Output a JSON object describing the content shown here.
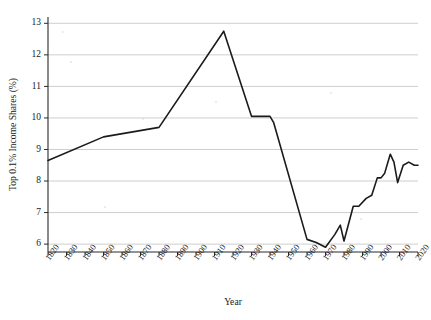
{
  "chart_data": {
    "type": "line",
    "title": "",
    "subtitle": "",
    "xlabel": "Year",
    "ylabel": "Top 0.1% Income Shares (%)",
    "xlim": [
      1820,
      2020
    ],
    "ylim": [
      5.75,
      13.2
    ],
    "yticks": [
      6,
      7,
      8,
      9,
      10,
      11,
      12,
      13
    ],
    "ytick_labels": [
      "6",
      "7",
      "8",
      "9",
      "10",
      "11",
      "12",
      "13"
    ],
    "xticks": [
      1820,
      1830,
      1840,
      1850,
      1860,
      1870,
      1880,
      1890,
      1900,
      1910,
      1920,
      1930,
      1940,
      1950,
      1960,
      1970,
      1980,
      1990,
      2000,
      2010,
      2020
    ],
    "xtick_labels": [
      "1820",
      "1830",
      "1840",
      "1850",
      "1860",
      "1870",
      "1880",
      "1890",
      "1900",
      "1910",
      "1920",
      "1930",
      "1940",
      "1950",
      "1960",
      "1970",
      "1980",
      "1990",
      "2000",
      "2010",
      "2020"
    ],
    "grid": "horizontal",
    "legend": "none",
    "series": [
      {
        "name": "Top 0.1% Income Shares",
        "color": "#1b1b1b",
        "x": [
          1820,
          1850,
          1880,
          1915,
          1930,
          1940,
          1942,
          1960,
          1965,
          1970,
          1975,
          1978,
          1980,
          1985,
          1988,
          1992,
          1995,
          1998,
          2000,
          2002,
          2005,
          2007,
          2009,
          2012,
          2015,
          2018,
          2020
        ],
        "values": [
          8.65,
          9.4,
          9.7,
          12.75,
          10.05,
          10.05,
          9.85,
          6.15,
          6.05,
          5.9,
          6.3,
          6.6,
          6.1,
          7.2,
          7.2,
          7.45,
          7.55,
          8.1,
          8.1,
          8.25,
          8.85,
          8.6,
          7.95,
          8.5,
          8.6,
          8.5,
          8.5
        ]
      }
    ]
  },
  "figure": {
    "plot_left": 48,
    "plot_right": 418,
    "plot_top": 17,
    "plot_bottom": 252
  }
}
